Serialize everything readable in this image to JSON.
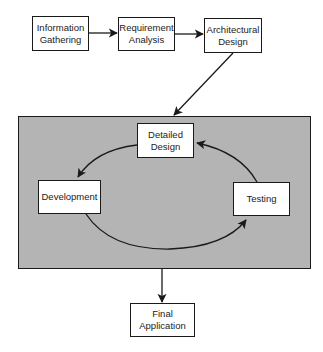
{
  "diagram": {
    "top_row": [
      {
        "id": "info",
        "label": "Information\nGathering",
        "x": 32,
        "y": 16,
        "w": 57,
        "h": 35
      },
      {
        "id": "req",
        "label": "Requirement\nAnalysis",
        "x": 118,
        "y": 17,
        "w": 57,
        "h": 34
      },
      {
        "id": "arch",
        "label": "Architectural\nDesign",
        "x": 204,
        "y": 18,
        "w": 58,
        "h": 35
      }
    ],
    "panel": {
      "x": 18,
      "y": 116,
      "w": 293,
      "h": 153,
      "color": "#b4b4b4"
    },
    "cycle": [
      {
        "id": "detailed",
        "label": "Detailed\nDesign",
        "x": 137,
        "y": 123,
        "w": 57,
        "h": 35
      },
      {
        "id": "dev",
        "label": "Development",
        "x": 38,
        "y": 180,
        "w": 63,
        "h": 34
      },
      {
        "id": "test",
        "label": "Testing",
        "x": 233,
        "y": 182,
        "w": 57,
        "h": 34
      }
    ],
    "final": {
      "id": "final",
      "label": "Final\nApplication",
      "x": 130,
      "y": 303,
      "w": 65,
      "h": 34
    }
  },
  "labels": {
    "info": "Information Gathering",
    "req": "Requirement Analysis",
    "arch": "Architectural Design",
    "detailed": "Detailed Design",
    "dev": "Development",
    "test": "Testing",
    "final": "Final Application"
  },
  "label_lines": {
    "info": [
      "Information",
      "Gathering"
    ],
    "req": [
      "Requirement",
      "Analysis"
    ],
    "arch": [
      "Architectural",
      "Design"
    ],
    "detailed": [
      "Detailed",
      "Design"
    ],
    "dev": [
      "Development"
    ],
    "test": [
      "Testing"
    ],
    "final": [
      "Final",
      "Application"
    ]
  },
  "edges": [
    {
      "from": "Information Gathering",
      "to": "Requirement Analysis"
    },
    {
      "from": "Requirement Analysis",
      "to": "Architectural Design"
    },
    {
      "from": "Architectural Design",
      "to": "Iterative Cycle Panel"
    },
    {
      "from": "Detailed Design",
      "to": "Development"
    },
    {
      "from": "Development",
      "to": "Testing"
    },
    {
      "from": "Testing",
      "to": "Detailed Design"
    },
    {
      "from": "Iterative Cycle Panel",
      "to": "Final Application"
    }
  ]
}
